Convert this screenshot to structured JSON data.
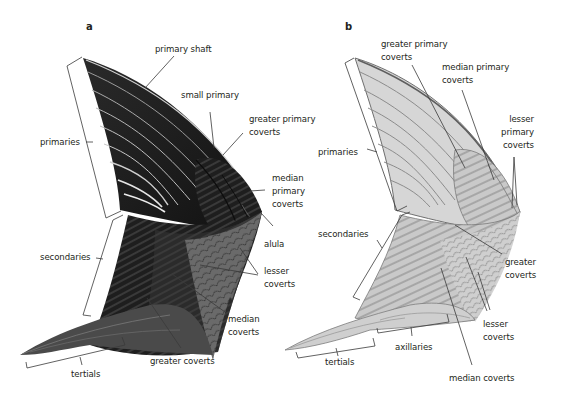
{
  "figure": {
    "type": "anatomical-diagram",
    "colors": {
      "background": "#ffffff",
      "text": "#231f20",
      "leader_line": "#3a3a3a",
      "wing_a_dark": "#1c1c1c",
      "wing_a_mid": "#3d3d3d",
      "wing_a_coverts": "#666666",
      "wing_a_highlight": "#d8d8d8",
      "wing_b_light": "#d9d9d9",
      "wing_b_mid": "#b3b3b3",
      "wing_b_outline": "#6f6f6f"
    }
  },
  "panels": [
    {
      "letter": "a",
      "view": "upper wing",
      "labels": {
        "primary_shaft": "primary shaft",
        "small_primary": "small primary",
        "greater_primary_coverts_1": "greater primary",
        "greater_primary_coverts_2": "coverts",
        "median_primary_coverts_1": "median",
        "median_primary_coverts_2": "primary",
        "median_primary_coverts_3": "coverts",
        "primaries": "primaries",
        "secondaries": "secondaries",
        "alula": "alula",
        "lesser_coverts_1": "lesser",
        "lesser_coverts_2": "coverts",
        "median_coverts_1": "median",
        "median_coverts_2": "coverts",
        "greater_coverts": "greater coverts",
        "tertials": "tertials"
      }
    },
    {
      "letter": "b",
      "view": "under wing",
      "labels": {
        "greater_primary_coverts_1": "greater primary",
        "greater_primary_coverts_2": "coverts",
        "median_primary_coverts_1": "median primary",
        "median_primary_coverts_2": "coverts",
        "lesser_primary_coverts_1": "lesser",
        "lesser_primary_coverts_2": "primary",
        "lesser_primary_coverts_3": "coverts",
        "primaries": "primaries",
        "secondaries": "secondaries",
        "greater_coverts_1": "greater",
        "greater_coverts_2": "coverts",
        "lesser_coverts_1": "lesser",
        "lesser_coverts_2": "coverts",
        "axillaries": "axillaries",
        "tertials": "tertials",
        "median_coverts": "median coverts"
      }
    }
  ]
}
